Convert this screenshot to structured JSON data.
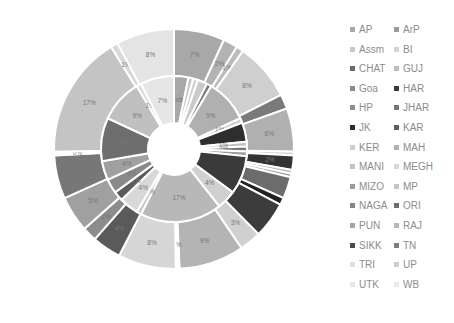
{
  "chart_data": {
    "type": "sunburst",
    "title": "",
    "center": [
      174,
      149
    ],
    "radii": {
      "hole": 26,
      "inner": 73,
      "outer": 120
    },
    "legend_position": "right",
    "legend": [
      {
        "label": "AP",
        "color": "#a8a8a8"
      },
      {
        "label": "ArP",
        "color": "#9a9a9a"
      },
      {
        "label": "Assm",
        "color": "#c8c8c8"
      },
      {
        "label": "BI",
        "color": "#d4d4d4"
      },
      {
        "label": "CHAT",
        "color": "#6a6a6a"
      },
      {
        "label": "GUJ",
        "color": "#bdbdbd"
      },
      {
        "label": "Goa",
        "color": "#8a8a8a"
      },
      {
        "label": "HAR",
        "color": "#3a3a3a"
      },
      {
        "label": "HP",
        "color": "#8e8e8e"
      },
      {
        "label": "JHAR",
        "color": "#777777"
      },
      {
        "label": "JK",
        "color": "#2c2c2c"
      },
      {
        "label": "KAR",
        "color": "#5e5e5e"
      },
      {
        "label": "KER",
        "color": "#cfcfcf"
      },
      {
        "label": "MAH",
        "color": "#b0b0b0"
      },
      {
        "label": "MANI",
        "color": "#c2c2c2"
      },
      {
        "label": "MEGH",
        "color": "#d8d8d8"
      },
      {
        "label": "MIZO",
        "color": "#9c9c9c"
      },
      {
        "label": "MP",
        "color": "#c6c6c6"
      },
      {
        "label": "NAGA",
        "color": "#868686"
      },
      {
        "label": "ORI",
        "color": "#6e6e6e"
      },
      {
        "label": "PUN",
        "color": "#a4a4a4"
      },
      {
        "label": "RAJ",
        "color": "#b8b8b8"
      },
      {
        "label": "SIKK",
        "color": "#4a4a4a"
      },
      {
        "label": "TN",
        "color": "#7c7c7c"
      },
      {
        "label": "TRI",
        "color": "#e0e0e0"
      },
      {
        "label": "UP",
        "color": "#cdcdcd"
      },
      {
        "label": "UTK",
        "color": "#e6e6e6"
      },
      {
        "label": "WB",
        "color": "#eaeaea"
      }
    ],
    "outer_ring": [
      {
        "value": 7,
        "label": "7%",
        "color": "#a8a8a8"
      },
      {
        "value": 2,
        "label": "2%",
        "color": "#b3b3b3"
      },
      {
        "value": 1,
        "label": "1%",
        "color": "#bcbcbc"
      },
      {
        "value": 8,
        "label": "8%",
        "color": "#cfcfcf"
      },
      {
        "value": 2,
        "label": "",
        "color": "#7a7a7a"
      },
      {
        "value": 6,
        "label": "6%",
        "color": "#b0b0b0"
      },
      {
        "value": 0.5,
        "label": "",
        "color": "#d0d0d0"
      },
      {
        "value": 2,
        "label": "2%",
        "color": "#333333"
      },
      {
        "value": 0.5,
        "label": "",
        "color": "#bbbbbb"
      },
      {
        "value": 0.5,
        "label": "",
        "color": "#9a9a9a"
      },
      {
        "value": 3,
        "label": "",
        "color": "#6c6c6c"
      },
      {
        "value": 1,
        "label": "",
        "color": "#222222"
      },
      {
        "value": 5,
        "label": "",
        "color": "#3c3c3c"
      },
      {
        "value": 3,
        "label": "3%",
        "color": "#d0d0d0"
      },
      {
        "value": 9,
        "label": "9%",
        "color": "#b4b4b4"
      },
      {
        "value": 0.5,
        "label": "0%",
        "color": "#ffffff"
      },
      {
        "value": 8,
        "label": "8%",
        "color": "#d6d6d6"
      },
      {
        "value": 4,
        "label": "4%",
        "color": "#5a5a5a"
      },
      {
        "value": 2,
        "label": "2%",
        "color": "#8c8c8c"
      },
      {
        "value": 5,
        "label": "5%",
        "color": "#a0a0a0"
      },
      {
        "value": 6,
        "label": "6%",
        "color": "#777777"
      },
      {
        "value": 0.5,
        "label": "0%",
        "color": "#ffffff"
      },
      {
        "value": 17,
        "label": "17%",
        "color": "#c4c4c4"
      },
      {
        "value": 1,
        "label": "1%",
        "color": "#d9d9d9"
      },
      {
        "value": 8,
        "label": "8%",
        "color": "#e4e4e4"
      }
    ],
    "inner_ring": [
      {
        "value": 3,
        "label": "India",
        "color": "#a8a8a8"
      },
      {
        "value": 1,
        "label": "",
        "color": "#c4c4c4"
      },
      {
        "value": 1,
        "label": "",
        "color": "#d0d0d0"
      },
      {
        "value": 2,
        "label": "",
        "color": "#cacaca"
      },
      {
        "value": 1,
        "label": "",
        "color": "#7a7a7a"
      },
      {
        "value": 9,
        "label": "9%",
        "color": "#b0b0b0"
      },
      {
        "value": 1,
        "label": "1%",
        "color": "#d0d0d0"
      },
      {
        "value": 4,
        "label": "",
        "color": "#2e2e2e"
      },
      {
        "value": 1,
        "label": "1%",
        "color": "#bdbdbd"
      },
      {
        "value": 1,
        "label": "2%",
        "color": "#777777"
      },
      {
        "value": 1,
        "label": "",
        "color": "#9a9a9a"
      },
      {
        "value": 8,
        "label": "",
        "color": "#3a3a3a"
      },
      {
        "value": 4,
        "label": "4%",
        "color": "#d0d0d0"
      },
      {
        "value": 17,
        "label": "17%",
        "color": "#b8b8b8"
      },
      {
        "value": 1,
        "label": "0%",
        "color": "#c8c8c8"
      },
      {
        "value": 4,
        "label": "4%",
        "color": "#d8d8d8"
      },
      {
        "value": 2,
        "label": "2%",
        "color": "#5c5c5c"
      },
      {
        "value": 3,
        "label": "3%",
        "color": "#8a8a8a"
      },
      {
        "value": 4,
        "label": "4%",
        "color": "#a0a0a0"
      },
      {
        "value": 9,
        "label": "9%",
        "color": "#6e6e6e"
      },
      {
        "value": 9,
        "label": "9%",
        "color": "#c0c0c0"
      },
      {
        "value": 1,
        "label": "1%",
        "color": "#dcdcdc"
      },
      {
        "value": 7,
        "label": "7%",
        "color": "#e6e6e6"
      }
    ]
  }
}
